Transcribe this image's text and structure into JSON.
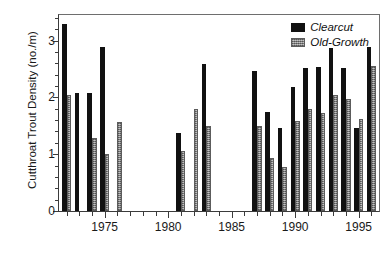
{
  "chart_data": {
    "type": "bar",
    "title": "",
    "xlabel": "",
    "ylabel": "Cutthroat Trout Density  (no./m)",
    "ylim": [
      0,
      3.45
    ],
    "yticks": [
      0,
      1,
      2,
      3
    ],
    "ytick_labels": [
      "0",
      "1",
      "2",
      "3"
    ],
    "ytick_minor_step": 0.2,
    "xlim": [
      1971.4,
      1996.6
    ],
    "xticks": [
      1972,
      1973,
      1974,
      1975,
      1976,
      1977,
      1978,
      1979,
      1980,
      1981,
      1982,
      1983,
      1984,
      1985,
      1986,
      1987,
      1988,
      1989,
      1990,
      1991,
      1992,
      1993,
      1994,
      1995,
      1996
    ],
    "xtick_labels_major": [
      "1975",
      "1980",
      "1985",
      "1990",
      "1995"
    ],
    "xticks_major": [
      1975,
      1980,
      1985,
      1990,
      1995
    ],
    "grid": false,
    "legend_position": "top-right",
    "categories": [
      1972,
      1973,
      1974,
      1975,
      1976,
      1981,
      1982,
      1983,
      1987,
      1988,
      1989,
      1990,
      1991,
      1992,
      1993,
      1994,
      1995,
      1996
    ],
    "series": [
      {
        "name": "Clearcut",
        "color": "#111111",
        "values": [
          3.29,
          2.07,
          2.07,
          2.88,
          null,
          1.38,
          null,
          2.59,
          2.47,
          1.75,
          1.46,
          2.19,
          2.51,
          2.53,
          2.87,
          2.52,
          1.46,
          2.89
        ]
      },
      {
        "name": "Old-Growth",
        "color": "#9a9a9a",
        "values": [
          2.05,
          null,
          1.29,
          1.0,
          1.57,
          1.06,
          1.79,
          1.49,
          1.49,
          0.93,
          0.78,
          1.58,
          1.8,
          1.72,
          2.05,
          1.97,
          1.62,
          2.56
        ]
      }
    ]
  },
  "legend": {
    "items": [
      {
        "label": "Clearcut",
        "swatch": "clearcut-swatch"
      },
      {
        "label": "Old-Growth",
        "swatch": "old-growth-swatch"
      }
    ]
  },
  "axis": {
    "y_title": "Cutthroat Trout Density  (no./m)"
  }
}
